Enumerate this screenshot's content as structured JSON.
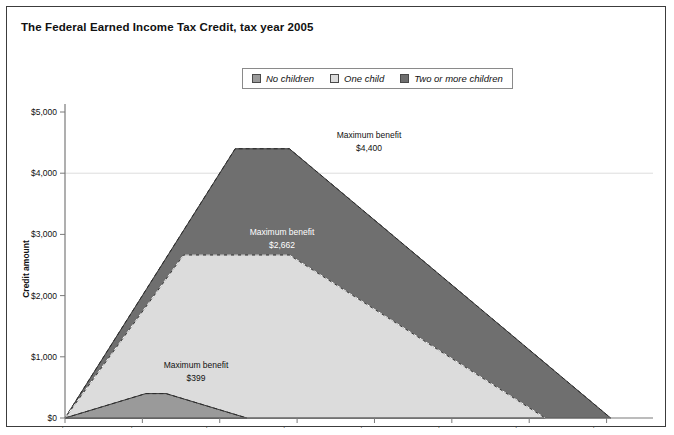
{
  "figure": {
    "title": "The Federal Earned Income Tax Credit, tax year 2005",
    "background": "#ffffff",
    "border_color": "#3c3c3c"
  },
  "legend": {
    "position": "top-center",
    "items": [
      {
        "label": "No children",
        "color": "#9a9a9a"
      },
      {
        "label": "One child",
        "color": "#dcdcdc"
      },
      {
        "label": "Two or more children",
        "color": "#6f6f6f"
      }
    ]
  },
  "axes": {
    "x": {
      "label": "",
      "ticks": [
        "$0",
        "$5,000",
        "$10,000",
        "$15,000",
        "$20,000",
        "$25,000",
        "$30,000",
        "$35,000"
      ],
      "tick_values": [
        0,
        5000,
        10000,
        15000,
        20000,
        25000,
        30000,
        35000
      ],
      "min": 0,
      "max": 38000
    },
    "y": {
      "label": "Credit amount",
      "ticks": [
        "$0",
        "$1,000",
        "$2,000",
        "$3,000",
        "$4,000",
        "$5,000"
      ],
      "tick_values": [
        0,
        1000,
        2000,
        3000,
        4000,
        5000
      ],
      "min": 0,
      "max": 5000,
      "gridline_at": 4000
    }
  },
  "annotations": [
    {
      "name": "two-or-more-children-max",
      "title": "Maximum benefit",
      "value": "$4,400",
      "x": 362,
      "y": 131
    },
    {
      "name": "one-child-max",
      "title": "Maximum benefit",
      "value": "$2,662",
      "x": 275,
      "y": 228,
      "color": "#ffffff"
    },
    {
      "name": "no-children-max",
      "title": "Maximum benefit",
      "value": "$399",
      "x": 189,
      "y": 361
    }
  ],
  "chart_data": {
    "type": "area",
    "title": "The Federal Earned Income Tax Credit, tax year 2005",
    "xlabel": "",
    "ylabel": "Credit amount",
    "xlim": [
      0,
      38000
    ],
    "ylim": [
      0,
      5000
    ],
    "grid": "single horizontal gridline at $4,000",
    "legend_position": "top-center",
    "x_tick_labels": [
      "$0",
      "$5,000",
      "$10,000",
      "$15,000",
      "$20,000",
      "$25,000",
      "$30,000",
      "$35,000"
    ],
    "y_tick_labels": [
      "$0",
      "$1,000",
      "$2,000",
      "$3,000",
      "$4,000",
      "$5,000"
    ],
    "series": [
      {
        "name": "No children",
        "color": "#9a9a9a",
        "max_benefit": 399,
        "max_benefit_label": "$399",
        "points": [
          [
            0,
            0
          ],
          [
            5220,
            399
          ],
          [
            6530,
            399
          ],
          [
            11750,
            0
          ]
        ]
      },
      {
        "name": "One child",
        "color": "#dcdcdc",
        "max_benefit": 2662,
        "max_benefit_label": "$2,662",
        "points": [
          [
            0,
            0
          ],
          [
            7660,
            2662
          ],
          [
            14500,
            2662
          ],
          [
            31030,
            0
          ]
        ]
      },
      {
        "name": "Two or more children",
        "color": "#6f6f6f",
        "max_benefit": 4400,
        "max_benefit_label": "$4,400",
        "points": [
          [
            0,
            0
          ],
          [
            11000,
            4400
          ],
          [
            14500,
            4400
          ],
          [
            35263,
            0
          ]
        ]
      }
    ]
  }
}
